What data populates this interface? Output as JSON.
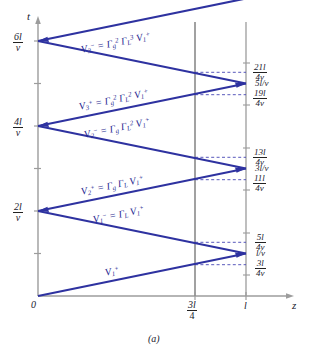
{
  "figure": {
    "caption": "(a)",
    "axes": {
      "y_axis_name": "t",
      "x_axis_name": "z",
      "origin_label": "0",
      "y_ticks": [
        {
          "num": "6l",
          "den": "v"
        },
        {
          "num": "4l",
          "den": "v"
        },
        {
          "num": "2l",
          "den": "v"
        }
      ],
      "x_ticks": [
        {
          "label_num": "3l",
          "label_den": "4"
        },
        {
          "label_plain": "l"
        }
      ]
    },
    "right_ticks": [
      {
        "type": "frac",
        "num": "21l",
        "den": "4v"
      },
      {
        "type": "plain",
        "text": "5l/v"
      },
      {
        "type": "frac",
        "num": "19l",
        "den": "4v"
      },
      {
        "type": "frac",
        "num": "13l",
        "den": "4v"
      },
      {
        "type": "plain",
        "text": "3l/v"
      },
      {
        "type": "frac",
        "num": "11l",
        "den": "4v"
      },
      {
        "type": "frac",
        "num": "5l",
        "den": "4v"
      },
      {
        "type": "plain",
        "text": "l/v"
      },
      {
        "type": "frac",
        "num": "3l",
        "den": "4v"
      }
    ],
    "wave_labels": [
      {
        "id": "V3minus",
        "html": "V<sub>3</sub><sup>−</sup> = Γ<sub>g</sub><sup>2</sup> Γ<sub>L</sub><sup>3</sup> V<sub>1</sub><sup>+</sup>"
      },
      {
        "id": "V3plus",
        "html": "V<sub>3</sub><sup>+</sup> = Γ<sub>g</sub><sup>2</sup> Γ<sub>L</sub><sup>2</sup> V<sub>1</sub><sup>+</sup>"
      },
      {
        "id": "V2minus",
        "html": "V<sub>2</sub><sup>−</sup> = Γ<sub>g</sub> Γ<sub>L</sub><sup>2</sup> V<sub>1</sub><sup>+</sup>"
      },
      {
        "id": "V2plus",
        "html": "V<sub>2</sub><sup>+</sup> = Γ<sub>g</sub> Γ<sub>L</sub> V<sub>1</sub><sup>+</sup>"
      },
      {
        "id": "V1minus",
        "html": "V<sub>1</sub><sup>−</sup> = Γ<sub>L</sub> V<sub>1</sub><sup>+</sup>"
      },
      {
        "id": "V1plus",
        "html": "V<sub>1</sub><sup>+</sup>"
      }
    ],
    "colors": {
      "trace": "#2e32a0",
      "axis": "#9a9a9a",
      "vline": "#777777",
      "dashed": "#3a3ab0"
    }
  },
  "chart_data": {
    "type": "line",
    "title": "",
    "xlabel": "z",
    "ylabel": "t",
    "xlim": [
      0,
      1
    ],
    "ylim": [
      0,
      6.2
    ],
    "grid": false,
    "legend": "none",
    "x_tick_values": [
      0,
      0.75,
      1.0
    ],
    "x_tick_labels": [
      "0",
      "3l/4",
      "l"
    ],
    "y_tick_values": [
      2,
      4,
      6
    ],
    "y_tick_labels": [
      "2l/v",
      "4l/v",
      "6l/v"
    ],
    "series": [
      {
        "name": "bounce-diagram",
        "comment": "zig-zag of voltage wave; x in units of l, y in units of l/v",
        "x": [
          0,
          1,
          0,
          1,
          0,
          1,
          0,
          1
        ],
        "y": [
          0,
          1,
          2,
          3,
          4,
          5,
          6,
          7
        ]
      }
    ],
    "annotations": [
      {
        "text": "V1+",
        "x": 0.4,
        "y": 0.4
      },
      {
        "text": "V1- = GL V1+",
        "x": 0.42,
        "y": 1.72
      },
      {
        "text": "V2+ = Gg GL V1+",
        "x": 0.4,
        "y": 2.3
      },
      {
        "text": "V2- = Gg GL^2 V1+",
        "x": 0.45,
        "y": 3.75
      },
      {
        "text": "V3+ = Gg^2 GL^2 V1+",
        "x": 0.38,
        "y": 4.35
      },
      {
        "text": "V3- = Gg^2 GL^3 V1+",
        "x": 0.45,
        "y": 5.8
      }
    ],
    "dashed_markers_at_x": 0.75,
    "dashed_marker_y": [
      0.75,
      1.25,
      2.75,
      3.25,
      4.75,
      5.25
    ],
    "right_axis_labels": [
      "3l/4v",
      "l/v",
      "5l/4v",
      "11l/4v",
      "3l/v",
      "13l/4v",
      "19l/4v",
      "5l/v",
      "21l/4v"
    ]
  }
}
